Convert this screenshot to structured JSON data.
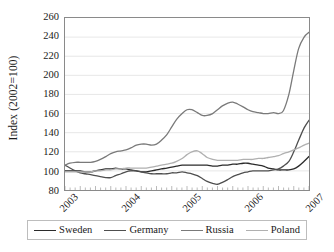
{
  "chart_data": {
    "type": "line",
    "title": "",
    "xlabel": "",
    "ylabel": "Index (2002=100)",
    "ylim": [
      80,
      260
    ],
    "ytick_step": 20,
    "yticks": [
      260,
      240,
      220,
      200,
      180,
      160,
      140,
      120,
      100,
      80
    ],
    "xlim": [
      2003,
      2007
    ],
    "xticks": [
      "2003",
      "2004",
      "2005",
      "2006",
      "2007"
    ],
    "grid": "horizontal",
    "legend_position": "bottom",
    "x": [
      2003.0,
      2003.08,
      2003.17,
      2003.25,
      2003.33,
      2003.42,
      2003.5,
      2003.58,
      2003.67,
      2003.75,
      2003.83,
      2003.92,
      2004.0,
      2004.08,
      2004.17,
      2004.25,
      2004.33,
      2004.42,
      2004.5,
      2004.58,
      2004.67,
      2004.75,
      2004.83,
      2004.92,
      2005.0,
      2005.08,
      2005.17,
      2005.25,
      2005.33,
      2005.42,
      2005.5,
      2005.58,
      2005.67,
      2005.75,
      2005.83,
      2005.92,
      2006.0,
      2006.08,
      2006.17,
      2006.25,
      2006.33,
      2006.42,
      2006.5,
      2006.58,
      2006.67,
      2006.75,
      2006.83,
      2006.92,
      2007.0
    ],
    "series": [
      {
        "name": "Sweden",
        "color": "#2b2b2b",
        "values": [
          100,
          100,
          100,
          100,
          99,
          99,
          100,
          101,
          102,
          102,
          103,
          102,
          102,
          101,
          100,
          99,
          99,
          100,
          101,
          102,
          103,
          104,
          105,
          106,
          106,
          106,
          106,
          106,
          106,
          105,
          105,
          106,
          106,
          107,
          107,
          108,
          108,
          107,
          106,
          105,
          103,
          102,
          101,
          101,
          101,
          102,
          105,
          110,
          115
        ]
      },
      {
        "name": "Germany",
        "color": "#4f4f4f",
        "values": [
          106,
          103,
          100,
          98,
          97,
          96,
          95,
          94,
          93,
          93,
          95,
          97,
          99,
          100,
          100,
          99,
          98,
          97,
          97,
          97,
          97,
          98,
          98,
          99,
          98,
          97,
          95,
          92,
          89,
          87,
          86,
          88,
          91,
          94,
          96,
          98,
          99,
          100,
          100,
          100,
          100,
          101,
          102,
          105,
          110,
          120,
          132,
          145,
          153
        ]
      },
      {
        "name": "Russia",
        "color": "#7a7a7a",
        "values": [
          106,
          108,
          109,
          109,
          109,
          109,
          110,
          112,
          115,
          118,
          120,
          121,
          122,
          124,
          127,
          128,
          128,
          127,
          128,
          132,
          138,
          146,
          154,
          160,
          164,
          164,
          161,
          158,
          158,
          160,
          164,
          168,
          171,
          172,
          170,
          167,
          164,
          162,
          161,
          160,
          160,
          161,
          160,
          163,
          180,
          205,
          228,
          240,
          245
        ]
      },
      {
        "name": "Poland",
        "color": "#b0b0b0",
        "values": [
          99,
          99,
          99,
          99,
          99,
          99,
          100,
          100,
          101,
          101,
          102,
          102,
          103,
          103,
          103,
          103,
          103,
          104,
          105,
          106,
          107,
          108,
          110,
          113,
          117,
          120,
          121,
          118,
          114,
          112,
          111,
          111,
          111,
          111,
          111,
          112,
          112,
          112,
          113,
          113,
          114,
          115,
          116,
          118,
          120,
          122,
          124,
          127,
          129
        ]
      }
    ]
  },
  "legend": {
    "items": [
      {
        "label": "Sweden"
      },
      {
        "label": "Germany"
      },
      {
        "label": "Russia"
      },
      {
        "label": "Poland"
      }
    ]
  }
}
